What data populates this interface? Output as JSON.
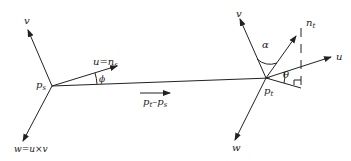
{
  "diagram": {
    "colors": {
      "line": "#222222",
      "background": "#ffffff"
    },
    "points": {
      "ps": {
        "label": "p",
        "sub": "s"
      },
      "pt": {
        "label": "p",
        "sub": "t"
      }
    },
    "left_frame": {
      "v_label": "v",
      "u_label": "u=n",
      "u_sub": "s",
      "w_label": "w=u×v",
      "angle_label": "ϕ"
    },
    "right_frame": {
      "v_label": "v",
      "u_label": "u",
      "w_label": "w",
      "n_label": "n",
      "n_sub": "t",
      "alpha_label": "α",
      "theta_label": "θ"
    },
    "connector": {
      "label_a": "p",
      "label_a_sub": "t",
      "minus": "–",
      "label_b": "p",
      "label_b_sub": "s"
    }
  }
}
